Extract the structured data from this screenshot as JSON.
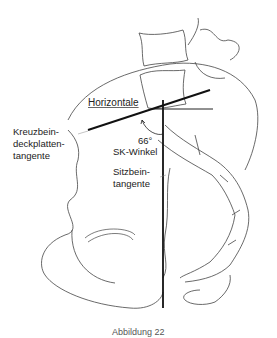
{
  "diagram": {
    "labels": {
      "horizontal": "Horizontale",
      "sacral_line_1": "Kreuzbein-",
      "sacral_line_2": "deckplatten-",
      "sacral_line_3": "tangente",
      "angle_value": "66°",
      "angle_name": "SK-Winkel",
      "ischial_line_1": "Sitzbein-",
      "ischial_line_2": "tangente",
      "caption_partial": "Abbildung 22"
    },
    "colors": {
      "stroke": "#333333",
      "text": "#222222",
      "background": "#ffffff"
    }
  }
}
